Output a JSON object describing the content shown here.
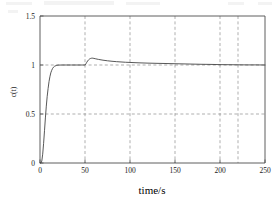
{
  "chart_data": {
    "type": "line",
    "title": "",
    "xlabel": "time/s",
    "ylabel": "c(t)",
    "xlim": [
      0,
      250
    ],
    "ylim": [
      0,
      1.5
    ],
    "xticks": [
      0,
      50,
      100,
      150,
      200,
      250
    ],
    "xtick_labels": [
      "0",
      "50",
      "100",
      "150",
      "200",
      "250"
    ],
    "yticks": [
      0,
      0.5,
      1,
      1.5
    ],
    "ytick_labels": [
      "0",
      "0.5",
      "1",
      "1.5"
    ],
    "grid": true,
    "grid_style": "dashed",
    "grid_x": [
      50,
      100,
      150,
      200,
      220
    ],
    "grid_y": [
      0.5,
      1.0
    ],
    "legend": null,
    "series": [
      {
        "name": "c(t)",
        "x": [
          0,
          1,
          2,
          3,
          4,
          5,
          6,
          7,
          8,
          9,
          10,
          11,
          12,
          13,
          14,
          15,
          16,
          18,
          20,
          25,
          30,
          35,
          40,
          45,
          49.5,
          50,
          51,
          52,
          53,
          54,
          55,
          56,
          57,
          58,
          59,
          60,
          62,
          65,
          70,
          75,
          80,
          85,
          90,
          95,
          100,
          110,
          120,
          130,
          140,
          150,
          160,
          170,
          180,
          190,
          200,
          210,
          220,
          230,
          240,
          250
        ],
        "y": [
          0.0,
          0.0,
          0.02,
          0.09,
          0.2,
          0.33,
          0.46,
          0.58,
          0.68,
          0.76,
          0.83,
          0.88,
          0.92,
          0.945,
          0.965,
          0.978,
          0.986,
          0.995,
          0.999,
          1.0,
          1.0,
          1.0,
          1.0,
          1.0,
          1.0,
          1.0,
          1.012,
          1.028,
          1.042,
          1.053,
          1.061,
          1.066,
          1.069,
          1.07,
          1.069,
          1.067,
          1.063,
          1.057,
          1.049,
          1.043,
          1.038,
          1.034,
          1.031,
          1.028,
          1.026,
          1.022,
          1.019,
          1.017,
          1.015,
          1.013,
          1.011,
          1.009,
          1.007,
          1.006,
          1.004,
          1.003,
          1.002,
          1.001,
          1.001,
          1.0
        ]
      }
    ],
    "annotations": [
      {
        "text": "step response rises to setpoint 1.0 near t=15 s"
      },
      {
        "text": "disturbance at t=50 s, peak overshoot about 1.07"
      }
    ]
  },
  "axes": {
    "x_title": "time/s",
    "y_title": "c(t)"
  },
  "colors": {
    "curve": "#3a3a3a",
    "grid": "#8c8c8c",
    "frame": "#4d4d4d",
    "background": "#ffffff"
  }
}
